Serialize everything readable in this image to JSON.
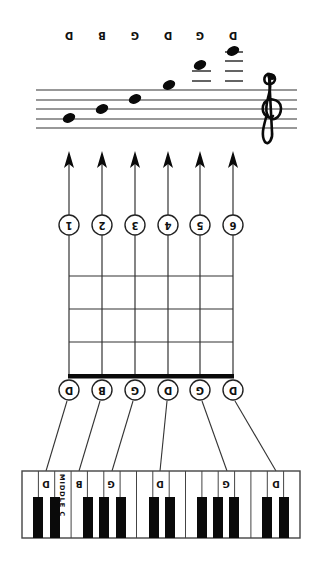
{
  "diagram": {
    "orientation": "rotated-180",
    "colors": {
      "ink": "#111111",
      "background": "#ffffff",
      "black_key": "#0a0a0a",
      "line": "#333333"
    },
    "staff": {
      "clef": "treble",
      "notes": [
        {
          "string": 1,
          "label": "D"
        },
        {
          "string": 2,
          "label": "B"
        },
        {
          "string": 3,
          "label": "G"
        },
        {
          "string": 4,
          "label": "D"
        },
        {
          "string": 5,
          "label": "G"
        },
        {
          "string": 6,
          "label": "D"
        }
      ]
    },
    "strings": [
      {
        "number": "1",
        "note": "D"
      },
      {
        "number": "2",
        "note": "B"
      },
      {
        "number": "3",
        "note": "G"
      },
      {
        "number": "4",
        "note": "D"
      },
      {
        "number": "5",
        "note": "G"
      },
      {
        "number": "6",
        "note": "D"
      }
    ],
    "fretboard": {
      "frets_shown": 4
    },
    "keyboard": {
      "white_keys": 17,
      "key_labels": [
        "D",
        "B",
        "G",
        "D",
        "G",
        "D"
      ],
      "middle_c_label": "MIDDLE C"
    }
  }
}
